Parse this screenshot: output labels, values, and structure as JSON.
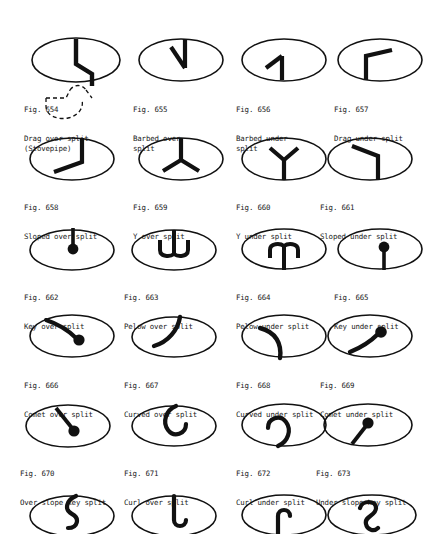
{
  "document": {
    "type": "figure-plate",
    "page_background": "#ffffff",
    "ink_color": "#111111",
    "topic": "split markings reference plate",
    "figure_number_prefix": "Fig."
  },
  "rows": [
    {
      "row_index": 0,
      "figures": [
        {
          "number": "Fig. 654",
          "description": "Drag over split\n(Stovepipe)",
          "glyph": "drag-over-split",
          "has_dashed_callout": true,
          "dashed_callout_name": "stovepipe-outline"
        },
        {
          "number": "Fig. 655",
          "description": "Barbed over\nsplit",
          "glyph": "barbed-over-split",
          "has_dashed_callout": false
        },
        {
          "number": "Fig. 656",
          "description": "Barbed under\nsplit",
          "glyph": "barbed-under-split",
          "has_dashed_callout": false
        },
        {
          "number": "Fig. 657",
          "description": "Drag under split",
          "glyph": "drag-under-split",
          "has_dashed_callout": false
        }
      ]
    },
    {
      "row_index": 1,
      "figures": [
        {
          "number": "Fig. 658",
          "description": "Sloped over split",
          "glyph": "sloped-over-split",
          "has_dashed_callout": false
        },
        {
          "number": "Fig. 659",
          "description": "Y over split",
          "glyph": "y-over-split",
          "has_dashed_callout": false
        },
        {
          "number": "Fig. 660",
          "description": "Y under split",
          "glyph": "y-under-split",
          "has_dashed_callout": false
        },
        {
          "number": "Fig. 661",
          "description": "Sloped under split",
          "glyph": "sloped-under-split",
          "has_dashed_callout": false
        }
      ]
    },
    {
      "row_index": 2,
      "figures": [
        {
          "number": "Fig. 662",
          "description": "Key over split",
          "glyph": "key-over-split",
          "has_dashed_callout": false
        },
        {
          "number": "Fig. 663",
          "description": "Pelow over split",
          "glyph": "pelow-over-split",
          "has_dashed_callout": false
        },
        {
          "number": "Fig. 664",
          "description": "Pelow under split",
          "glyph": "pelow-under-split",
          "has_dashed_callout": false
        },
        {
          "number": "Fig. 665",
          "description": "Key under split",
          "glyph": "key-under-split",
          "has_dashed_callout": false
        }
      ]
    },
    {
      "row_index": 3,
      "figures": [
        {
          "number": "Fig. 666",
          "description": "Comet over split",
          "glyph": "comet-over-split",
          "has_dashed_callout": false
        },
        {
          "number": "Fig. 667",
          "description": "Curved over split",
          "glyph": "curved-over-split",
          "has_dashed_callout": false
        },
        {
          "number": "Fig. 668",
          "description": "Curved under split",
          "glyph": "curved-under-split",
          "has_dashed_callout": false
        },
        {
          "number": "Fig. 669",
          "description": "Comet under split",
          "glyph": "comet-under-split",
          "has_dashed_callout": false
        }
      ]
    },
    {
      "row_index": 4,
      "figures": [
        {
          "number": "Fig. 670",
          "description": "Over slope key split",
          "glyph": "over-slope-key-split",
          "has_dashed_callout": false
        },
        {
          "number": "Fig. 671",
          "description": "Curl over split",
          "glyph": "curl-over-split",
          "has_dashed_callout": false
        },
        {
          "number": "Fig. 672",
          "description": "Curl under split",
          "glyph": "curl-under-split",
          "has_dashed_callout": false
        },
        {
          "number": "Fig. 673",
          "description": "Under slope key split",
          "glyph": "under-slope-key-split",
          "has_dashed_callout": false
        }
      ]
    },
    {
      "row_index": 5,
      "partial_row": true,
      "figures": [
        {
          "number": "",
          "description": "",
          "glyph": "hook-down-left-split",
          "has_dashed_callout": false
        },
        {
          "number": "",
          "description": "",
          "glyph": "hook-down-right-split",
          "has_dashed_callout": false
        },
        {
          "number": "",
          "description": "",
          "glyph": "hook-up-left-split",
          "has_dashed_callout": false
        },
        {
          "number": "",
          "description": "",
          "glyph": "question-hook-split",
          "has_dashed_callout": false
        }
      ]
    }
  ]
}
